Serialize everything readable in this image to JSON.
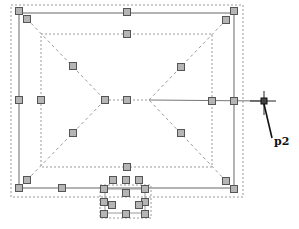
{
  "drawing": {
    "background": "#ffffff",
    "line_color": "#9a9a9a",
    "grip_fill": "#b5b5b5",
    "grip_stroke": "#555555",
    "cursor_color": "#222222",
    "point_label": "p2",
    "outer_dashed_frame": {
      "x1": 11,
      "y1": 5,
      "x2": 243,
      "y2": 197
    },
    "solid_frame": {
      "x1": 19,
      "y1": 13,
      "x2": 234,
      "y2": 188
    },
    "inner_dashed_rect": {
      "x1": 41,
      "y1": 34,
      "x2": 212,
      "y2": 167
    },
    "ridge_line": {
      "x1": 105,
      "y1": 100,
      "x2": 149,
      "y2": 100
    },
    "rubberband_line": {
      "x1": 149,
      "y1": 100,
      "x2": 264,
      "y2": 101
    },
    "hip_lines": [
      {
        "x1": 27,
        "y1": 19,
        "x2": 105,
        "y2": 100
      },
      {
        "x1": 226,
        "y1": 20,
        "x2": 149,
        "y2": 100
      },
      {
        "x1": 27,
        "y1": 180,
        "x2": 105,
        "y2": 100
      },
      {
        "x1": 226,
        "y1": 181,
        "x2": 149,
        "y2": 100
      }
    ],
    "bay": {
      "dashed": {
        "x1": 100,
        "y1": 185,
        "x2": 151,
        "y2": 218
      },
      "solid": {
        "x1": 105,
        "y1": 189,
        "x2": 145,
        "y2": 213
      }
    },
    "grips": [
      {
        "x": 19,
        "y": 11
      },
      {
        "x": 127,
        "y": 12
      },
      {
        "x": 234,
        "y": 11
      },
      {
        "x": 27,
        "y": 19
      },
      {
        "x": 226,
        "y": 20
      },
      {
        "x": 127,
        "y": 34
      },
      {
        "x": 73,
        "y": 66
      },
      {
        "x": 181,
        "y": 67
      },
      {
        "x": 19,
        "y": 100
      },
      {
        "x": 41,
        "y": 100
      },
      {
        "x": 105,
        "y": 100
      },
      {
        "x": 127,
        "y": 100
      },
      {
        "x": 212,
        "y": 101
      },
      {
        "x": 234,
        "y": 101
      },
      {
        "x": 73,
        "y": 133
      },
      {
        "x": 181,
        "y": 133
      },
      {
        "x": 127,
        "y": 167
      },
      {
        "x": 27,
        "y": 180
      },
      {
        "x": 226,
        "y": 181
      },
      {
        "x": 19,
        "y": 188
      },
      {
        "x": 62,
        "y": 188
      },
      {
        "x": 234,
        "y": 189
      },
      {
        "x": 113,
        "y": 180
      },
      {
        "x": 126,
        "y": 180
      },
      {
        "x": 139,
        "y": 180
      },
      {
        "x": 104,
        "y": 189
      },
      {
        "x": 145,
        "y": 189
      },
      {
        "x": 126,
        "y": 193
      },
      {
        "x": 104,
        "y": 202
      },
      {
        "x": 145,
        "y": 202
      },
      {
        "x": 112,
        "y": 205
      },
      {
        "x": 139,
        "y": 205
      },
      {
        "x": 104,
        "y": 214
      },
      {
        "x": 126,
        "y": 214
      },
      {
        "x": 145,
        "y": 214
      }
    ],
    "cursor": {
      "x": 264,
      "y": 101
    },
    "leader": {
      "x1": 264,
      "y1": 104,
      "x2": 272,
      "y2": 138
    },
    "label_pos": {
      "x": 274,
      "y": 136
    }
  }
}
